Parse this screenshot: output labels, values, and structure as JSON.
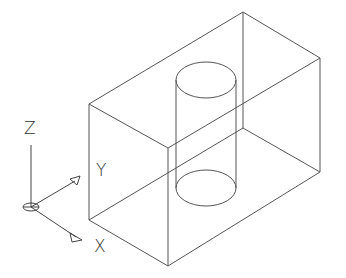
{
  "diagram": {
    "axes": {
      "z_label": "Z",
      "y_label": "Y",
      "x_label": "X"
    },
    "colors": {
      "line": "#555555",
      "background": "#ffffff"
    }
  }
}
